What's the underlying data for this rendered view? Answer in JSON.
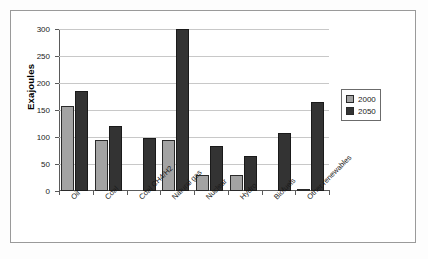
{
  "chart_data": {
    "type": "bar",
    "title": "",
    "xlabel": "",
    "ylabel": "Exajoules",
    "ylim": [
      0,
      300
    ],
    "yticks": [
      0,
      50,
      100,
      150,
      200,
      250,
      300
    ],
    "ytick_labels": [
      "0",
      "50",
      "100",
      "150",
      "200",
      "250",
      "300"
    ],
    "grid": true,
    "legend_position": "right",
    "categories": [
      "Oil",
      "Coal",
      "Coal CH4/H2",
      "Natural gas",
      "Nuclear",
      "Hydro",
      "Biofuels",
      "Other renewables"
    ],
    "series": [
      {
        "name": "2000",
        "color": "#a3a3a3",
        "values": [
          158,
          95,
          0,
          95,
          30,
          30,
          0,
          4
        ]
      },
      {
        "name": "2050",
        "color": "#333333",
        "values": [
          185,
          120,
          98,
          300,
          84,
          64,
          108,
          164
        ]
      }
    ]
  }
}
